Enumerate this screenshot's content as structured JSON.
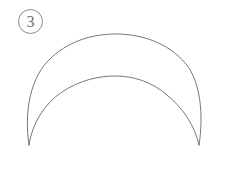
{
  "figure": {
    "label": "3",
    "label_badge_name": "circled-number-badge",
    "background_color": "#ffffff",
    "stroke_color": "#777777",
    "badge_stroke_color": "#8a8a8a",
    "stroke_width": 1,
    "shape_type": "crescent",
    "cusps": [
      {
        "x": 29,
        "y": 145
      },
      {
        "x": 199,
        "y": 145
      }
    ],
    "outer_arc": {
      "name": "outer-arc",
      "start": {
        "x": 29,
        "y": 145
      },
      "end": {
        "x": 199,
        "y": 145
      },
      "apex": {
        "x": 115,
        "y": 42
      },
      "leftmost_x": 27,
      "rightmost_x": 201
    },
    "inner_arc": {
      "name": "inner-arc",
      "start": {
        "x": 29,
        "y": 145
      },
      "end": {
        "x": 199,
        "y": 145
      },
      "apex": {
        "x": 115,
        "y": 84
      },
      "leftmost_x": 38,
      "rightmost_x": 192
    }
  },
  "canvas": {
    "width": 225,
    "height": 177
  }
}
